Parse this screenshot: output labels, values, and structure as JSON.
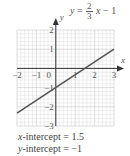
{
  "chart_data": {
    "type": "line",
    "equation": {
      "lhs": "y",
      "numerator": "2",
      "denominator": "3",
      "rhs_var": "x",
      "rhs_const": "− 1"
    },
    "xlabel": "x",
    "ylabel": "y",
    "xlim": [
      -2,
      3
    ],
    "ylim": [
      -3,
      2
    ],
    "x_ticks": [
      "−2",
      "−1",
      "0",
      "1",
      "2",
      "3"
    ],
    "y_ticks": [
      "2",
      "1",
      "−1",
      "−2",
      "−3"
    ],
    "grid": true,
    "series": [
      {
        "name": "y = 2/3 x − 1",
        "x": [
          -2,
          3
        ],
        "y": [
          -2.333,
          1
        ],
        "color": "#555555"
      }
    ],
    "annotations": {
      "x_intercept": "x-intercept = 1.5",
      "y_intercept": "y-intercept = −1"
    }
  },
  "captions": {
    "x_intercept_label": "x",
    "x_intercept_rest": "-intercept = 1.5",
    "y_intercept_label": "y",
    "y_intercept_rest": "-intercept = −1"
  },
  "colors": {
    "grid_minor": "#e2e2e2",
    "grid_major": "#c8c8c8",
    "axis": "#333333",
    "line": "#555555"
  }
}
